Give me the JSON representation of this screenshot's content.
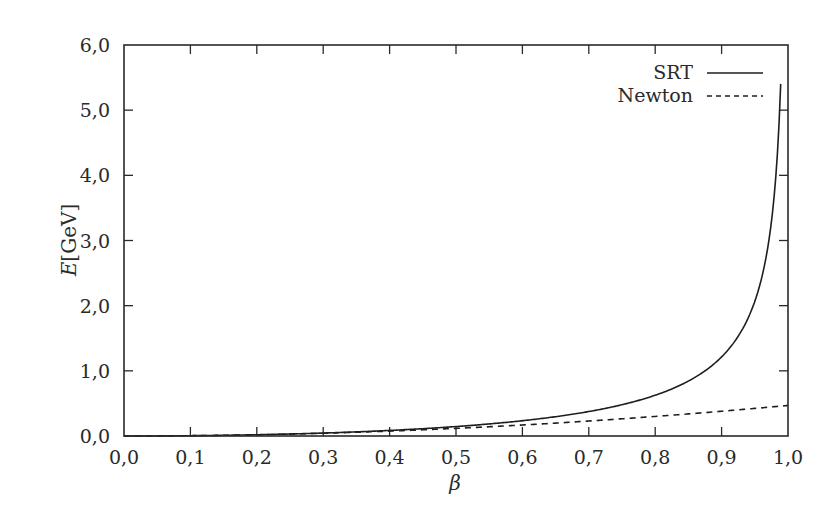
{
  "chart_data": {
    "type": "line",
    "title": "",
    "xlabel": "β",
    "ylabel": "E[GeV]",
    "ylabel_italic_part": "E",
    "ylabel_unit_part": "[GeV]",
    "xlim": [
      0.0,
      1.0
    ],
    "ylim": [
      0.0,
      6.0
    ],
    "x_ticks": [
      0.0,
      0.1,
      0.2,
      0.3,
      0.4,
      0.5,
      0.6,
      0.7,
      0.8,
      0.9,
      1.0
    ],
    "x_tick_labels": [
      "0,0",
      "0,1",
      "0,2",
      "0,3",
      "0,4",
      "0,5",
      "0,6",
      "0,7",
      "0,8",
      "0,9",
      "1,0"
    ],
    "y_ticks": [
      0.0,
      1.0,
      2.0,
      3.0,
      4.0,
      5.0,
      6.0
    ],
    "y_tick_labels": [
      "0,0",
      "1,0",
      "2,0",
      "3,0",
      "4,0",
      "5,0",
      "6,0"
    ],
    "grid": false,
    "legend_position": "upper right",
    "series": [
      {
        "name": "SRT",
        "style": "solid",
        "color": "#1e1e1e",
        "x": [
          0.0,
          0.1,
          0.2,
          0.3,
          0.4,
          0.5,
          0.6,
          0.7,
          0.8,
          0.85,
          0.9,
          0.93,
          0.95,
          0.97,
          0.98,
          0.985,
          0.989
        ],
        "values": [
          0.0,
          0.005,
          0.019,
          0.045,
          0.085,
          0.145,
          0.235,
          0.376,
          0.625,
          0.843,
          1.214,
          1.613,
          2.066,
          2.92,
          3.776,
          4.557,
          5.55
        ]
      },
      {
        "name": "Newton",
        "style": "dashed",
        "color": "#1e1e1e",
        "x": [
          0.0,
          0.1,
          0.2,
          0.3,
          0.4,
          0.5,
          0.6,
          0.7,
          0.8,
          0.9,
          1.0
        ],
        "values": [
          0.0,
          0.005,
          0.019,
          0.042,
          0.075,
          0.117,
          0.169,
          0.23,
          0.3,
          0.38,
          0.469
        ]
      }
    ]
  }
}
